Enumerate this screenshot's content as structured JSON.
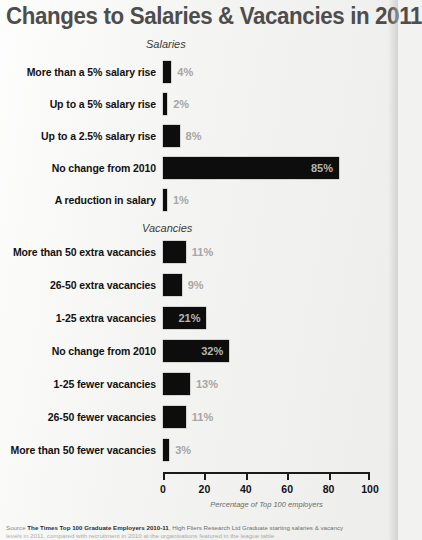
{
  "chart_data": {
    "type": "bar",
    "orientation": "horizontal",
    "title": "Changes to Salaries & Vacancies in 2011",
    "xlabel": "Percentage of Top 100 employers",
    "ylabel": "",
    "xlim": [
      0,
      100
    ],
    "xticks": [
      0,
      20,
      40,
      60,
      80,
      100
    ],
    "grid": false,
    "legend": null,
    "value_suffix": "%",
    "groups": [
      {
        "name": "Salaries",
        "categories": [
          "More than a 5% salary rise",
          "Up to a 5% salary rise",
          "Up to a 2.5% salary rise",
          "No change from 2010",
          "A reduction in salary"
        ],
        "values": [
          4,
          2,
          8,
          85,
          1
        ],
        "labels": [
          "4%",
          "2%",
          "8%",
          "85%",
          "1%"
        ]
      },
      {
        "name": "Vacancies",
        "categories": [
          "More than 50 extra vacancies",
          "26-50 extra vacancies",
          "1-25 extra vacancies",
          "No change from 2010",
          "1-25 fewer vacancies",
          "26-50 fewer vacancies",
          "More than 50 fewer vacancies"
        ],
        "values": [
          11,
          9,
          21,
          32,
          13,
          11,
          3
        ],
        "labels": [
          "11%",
          "9%",
          "21%",
          "32%",
          "13%",
          "11%",
          "3%"
        ]
      }
    ]
  },
  "colors": {
    "bar": "#0d0d0d",
    "title": "#4d4d4d",
    "value_label": "#a6a6a6",
    "background": "#f3f3f1"
  },
  "axis": {
    "ticks": [
      "0",
      "20",
      "40",
      "60",
      "80",
      "100"
    ],
    "caption": "Percentage of Top 100 employers"
  },
  "source": {
    "lead": "Source",
    "publication": "The Times Top 100 Graduate Employers 2010-11",
    "publisher": ", High Fliers Research Ltd",
    "note": "  Graduate starting salaries & vacancy",
    "line2": "levels in 2011, compared with recruitment in 2010 at the organisations featured in the league table"
  }
}
